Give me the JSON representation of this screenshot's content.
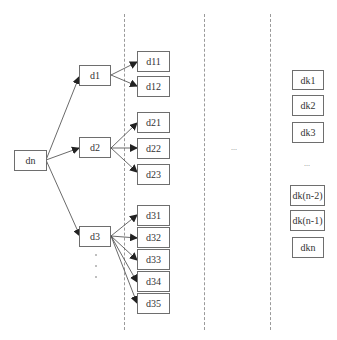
{
  "diagram": {
    "type": "tree",
    "root": {
      "label": "dn"
    },
    "level1": [
      {
        "label": "d1",
        "children": [
          "d11",
          "d12"
        ]
      },
      {
        "label": "d2",
        "children": [
          "d21",
          "d22",
          "d23"
        ]
      },
      {
        "label": "d3",
        "children": [
          "d31",
          "d32",
          "d33",
          "d34",
          "d35"
        ]
      }
    ],
    "level1_continuation": "...",
    "level2": {
      "d11": "d11",
      "d12": "d12",
      "d21": "d21",
      "d22": "d22",
      "d23": "d23",
      "d31": "d31",
      "d32": "d32",
      "d33": "d33",
      "d34": "d34",
      "d35": "d35"
    },
    "middle_ellipsis": "...",
    "last_column": {
      "items_top": [
        "dk1",
        "dk2",
        "dk3"
      ],
      "ellipsis": "...",
      "items_bottom": [
        "dk(n-2)",
        "dk(n-1)",
        "dkn"
      ]
    },
    "colors": {
      "box_border": "#6e6e6e",
      "arrow": "#333333",
      "dashed_line": "#9a9a9a"
    }
  }
}
